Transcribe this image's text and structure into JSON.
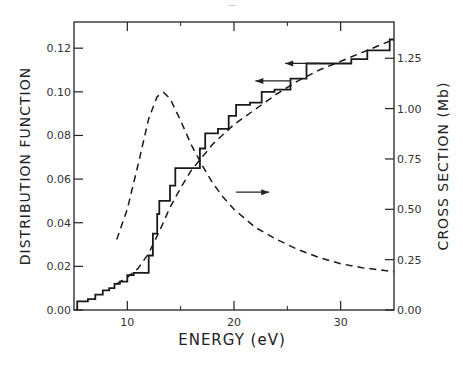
{
  "page_marker": "...",
  "chart_data": {
    "type": "line",
    "title": "",
    "xlabel": "ENERGY (eV)",
    "ylabel": "DISTRIBUTION FUNCTION",
    "y2label": "CROSS SECTION (Mb)",
    "xlim": [
      5,
      35
    ],
    "ylim": [
      0,
      0.132
    ],
    "y2lim": [
      0,
      1.43
    ],
    "xticks": [
      10,
      20,
      30
    ],
    "xticks_minor": [
      15,
      25
    ],
    "xtick_labels": [
      "10",
      "20",
      "30"
    ],
    "yticks": [
      0.0,
      0.02,
      0.04,
      0.06,
      0.08,
      0.1,
      0.12
    ],
    "ytick_labels": [
      "0.00",
      "0.02",
      "0.04",
      "0.06",
      "0.08",
      "0.10",
      "0.12"
    ],
    "y2ticks": [
      0.0,
      0.25,
      0.5,
      0.75,
      1.0,
      1.25
    ],
    "y2tick_labels": [
      "0.00",
      "0.25",
      "0.50",
      "0.75",
      "1.00",
      "1.25"
    ],
    "grid": false,
    "legend": "none (arrows indicate axis)",
    "series": [
      {
        "name": "Distribution function (histogram)",
        "style": "solid-step",
        "axis": "left",
        "x": [
          5.3,
          5.3,
          6.3,
          6.3,
          7.0,
          7.0,
          7.7,
          7.7,
          8.3,
          8.3,
          8.8,
          8.8,
          9.3,
          9.3,
          10.0,
          10.0,
          10.6,
          10.6,
          12.0,
          12.0,
          12.4,
          12.4,
          12.8,
          12.8,
          13.0,
          13.0,
          14.0,
          14.0,
          14.5,
          14.5,
          15.3,
          15.3,
          16.8,
          16.8,
          17.3,
          17.3,
          18.5,
          18.5,
          19.5,
          19.5,
          20.2,
          20.2,
          21.5,
          21.5,
          22.6,
          22.6,
          23.8,
          23.8,
          25.3,
          25.3,
          26.8,
          26.8,
          31.0,
          31.0,
          32.5,
          32.5,
          34.6,
          34.6,
          35.0
        ],
        "y": [
          0.0,
          0.004,
          0.004,
          0.005,
          0.005,
          0.007,
          0.007,
          0.009,
          0.009,
          0.01,
          0.01,
          0.012,
          0.012,
          0.013,
          0.013,
          0.016,
          0.016,
          0.017,
          0.017,
          0.025,
          0.025,
          0.035,
          0.035,
          0.044,
          0.044,
          0.05,
          0.05,
          0.057,
          0.057,
          0.065,
          0.065,
          0.065,
          0.065,
          0.074,
          0.074,
          0.081,
          0.081,
          0.083,
          0.083,
          0.089,
          0.089,
          0.094,
          0.094,
          0.095,
          0.095,
          0.1,
          0.1,
          0.101,
          0.101,
          0.106,
          0.106,
          0.113,
          0.113,
          0.115,
          0.115,
          0.119,
          0.119,
          0.124,
          0.124
        ]
      },
      {
        "name": "Distribution function (fit)",
        "style": "dashed",
        "axis": "left",
        "x": [
          9.0,
          10.0,
          11.0,
          12.0,
          13.0,
          14.0,
          15.0,
          16.0,
          17.0,
          18.0,
          20.0,
          22.0,
          24.0,
          26.0,
          28.0,
          30.0,
          32.0,
          34.0,
          35.0
        ],
        "y": [
          0.012,
          0.015,
          0.019,
          0.026,
          0.036,
          0.047,
          0.056,
          0.064,
          0.07,
          0.076,
          0.085,
          0.092,
          0.099,
          0.105,
          0.11,
          0.114,
          0.118,
          0.122,
          0.124
        ]
      },
      {
        "name": "Cross section",
        "style": "dashed",
        "axis": "right",
        "x": [
          9.0,
          10.0,
          11.0,
          12.0,
          12.8,
          13.4,
          14.0,
          15.0,
          16.0,
          17.0,
          18.0,
          19.0,
          20.0,
          22.0,
          24.0,
          26.0,
          28.0,
          30.0,
          32.0,
          35.0
        ],
        "y": [
          0.35,
          0.5,
          0.72,
          0.95,
          1.06,
          1.08,
          1.05,
          0.94,
          0.82,
          0.72,
          0.63,
          0.56,
          0.5,
          0.41,
          0.35,
          0.3,
          0.26,
          0.23,
          0.21,
          0.19
        ]
      }
    ],
    "annotations": [
      {
        "type": "arrow",
        "direction": "left",
        "x_from": 28.0,
        "x_to": 24.8,
        "y": 0.113,
        "refers_to": "left axis"
      },
      {
        "type": "arrow",
        "direction": "left",
        "x_from": 25.3,
        "x_to": 22.0,
        "y": 0.105,
        "refers_to": "left axis"
      },
      {
        "type": "arrow",
        "direction": "right",
        "x_from": 20.2,
        "x_to": 23.3,
        "y": 0.054,
        "refers_to": "right axis"
      }
    ]
  }
}
